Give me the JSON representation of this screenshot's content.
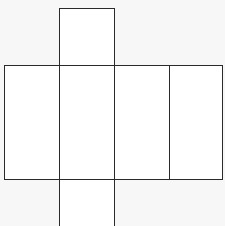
{
  "diagram": {
    "type": "cube-net",
    "line_color": "#2a2a2a",
    "face_fill": "#ffffff",
    "background": "#f7f7f7",
    "faces": [
      {
        "id": "top",
        "x": 59,
        "y": 8,
        "w": 56,
        "h": 58
      },
      {
        "id": "row-1",
        "x": 4,
        "y": 65,
        "w": 56,
        "h": 115
      },
      {
        "id": "row-2",
        "x": 59,
        "y": 65,
        "w": 56,
        "h": 115
      },
      {
        "id": "row-3",
        "x": 114,
        "y": 65,
        "w": 56,
        "h": 115
      },
      {
        "id": "row-4",
        "x": 169,
        "y": 65,
        "w": 54,
        "h": 115
      },
      {
        "id": "bottom",
        "x": 59,
        "y": 179,
        "w": 56,
        "h": 60
      }
    ]
  }
}
